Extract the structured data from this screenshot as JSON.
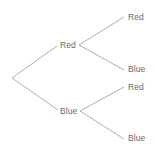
{
  "diagram": {
    "type": "probability-tree",
    "title": "",
    "style": {
      "background": "#ffffff",
      "edge_color": "#9a9a9a",
      "edge_width": 0.8,
      "text_color": "#6b6b6b",
      "font_size_px": 8.5
    },
    "root": {
      "name": "root",
      "label": "",
      "x": 12,
      "y": 78
    },
    "level1": [
      {
        "name": "level1-red",
        "label": "Red",
        "label_x": 60,
        "label_y": 41,
        "fork_x": 79,
        "fork_y": 45
      },
      {
        "name": "level1-blue",
        "label": "Blue",
        "label_x": 60,
        "label_y": 107,
        "fork_x": 80,
        "fork_y": 111
      }
    ],
    "level2": [
      {
        "name": "level2-red-red",
        "label": "Red",
        "label_x": 128,
        "label_y": 13,
        "end_x": 124,
        "end_y": 17,
        "parent": "level1-red"
      },
      {
        "name": "level2-red-blue",
        "label": "Blue",
        "label_x": 128,
        "label_y": 65,
        "end_x": 124,
        "end_y": 70,
        "parent": "level1-red"
      },
      {
        "name": "level2-blue-red",
        "label": "Red",
        "label_x": 128,
        "label_y": 83,
        "end_x": 124,
        "end_y": 87,
        "parent": "level1-blue"
      },
      {
        "name": "level2-blue-blue",
        "label": "Blue",
        "label_x": 128,
        "label_y": 134,
        "end_x": 124,
        "end_y": 139,
        "parent": "level1-blue"
      }
    ],
    "edges": [
      {
        "name": "edge-root-to-red",
        "x1": 12,
        "y1": 78,
        "x2": 57,
        "y2": 46
      },
      {
        "name": "edge-root-to-blue",
        "x1": 12,
        "y1": 78,
        "x2": 58,
        "y2": 110
      },
      {
        "name": "edge-red-to-red",
        "x1": 79,
        "y1": 45,
        "x2": 124,
        "y2": 17
      },
      {
        "name": "edge-red-to-blue",
        "x1": 79,
        "y1": 45,
        "x2": 124,
        "y2": 70
      },
      {
        "name": "edge-blue-to-red",
        "x1": 80,
        "y1": 111,
        "x2": 124,
        "y2": 87
      },
      {
        "name": "edge-blue-to-blue",
        "x1": 80,
        "y1": 111,
        "x2": 124,
        "y2": 139
      }
    ]
  }
}
